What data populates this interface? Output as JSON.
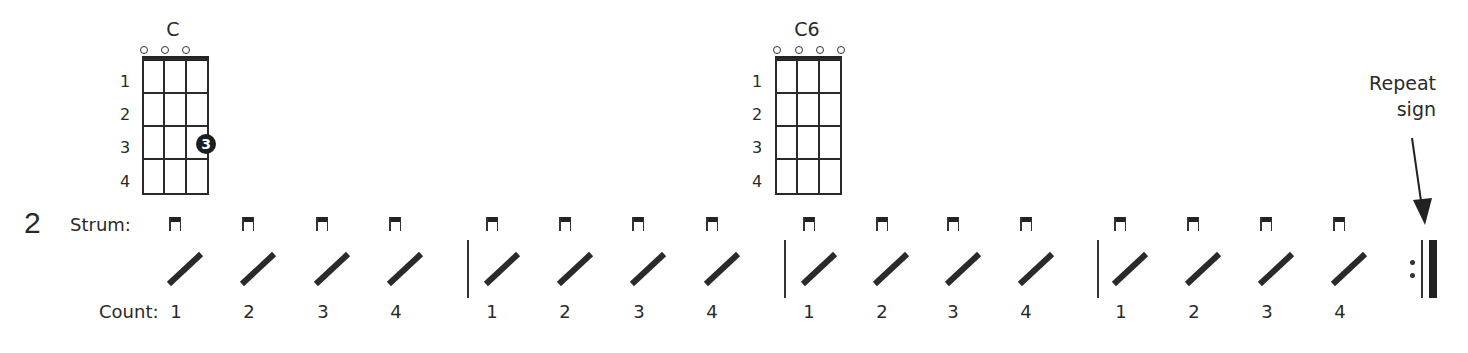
{
  "row_number": "2",
  "strum_label": "Strum:",
  "count_label": "Count:",
  "chords": [
    {
      "name": "C",
      "open_strings": 3,
      "fret_labels": [
        "1",
        "2",
        "3",
        "4"
      ],
      "fingering": {
        "string": 4,
        "fret": 3,
        "finger": "3"
      }
    },
    {
      "name": "C6",
      "open_strings": 4,
      "fret_labels": [
        "1",
        "2",
        "3",
        "4"
      ]
    }
  ],
  "strum_pattern": {
    "direction": "down",
    "measures": [
      {
        "counts": [
          "1",
          "2",
          "3",
          "4"
        ]
      },
      {
        "counts": [
          "1",
          "2",
          "3",
          "4"
        ]
      },
      {
        "counts": [
          "1",
          "2",
          "3",
          "4"
        ]
      },
      {
        "counts": [
          "1",
          "2",
          "3",
          "4"
        ]
      }
    ]
  },
  "annotation": {
    "line1": "Repeat",
    "line2": "sign"
  }
}
